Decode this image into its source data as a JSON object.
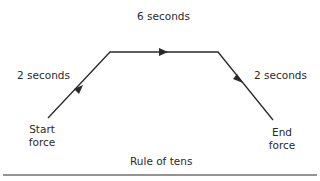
{
  "diagram": {
    "caption": "Rule of tens",
    "phases": [
      {
        "label": "2 seconds",
        "direction": "rising"
      },
      {
        "label": "6 seconds",
        "direction": "hold"
      },
      {
        "label": "2 seconds",
        "direction": "falling"
      }
    ],
    "start_label": {
      "line1": "Start",
      "line2": "force"
    },
    "end_label": {
      "line1": "End",
      "line2": "force"
    },
    "line_color": "#2a2a2a"
  }
}
